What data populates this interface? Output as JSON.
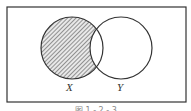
{
  "diagram": {
    "type": "venn",
    "universe": {
      "x": 7,
      "y": 7,
      "width": 179,
      "height": 95
    },
    "sets": [
      {
        "name": "X",
        "label": "X",
        "cx": 72,
        "cy": 48,
        "r": 31
      },
      {
        "name": "Y",
        "label": "Y",
        "cx": 121,
        "cy": 48,
        "r": 31
      }
    ],
    "shaded_region": "X minus Y",
    "shade_style": "diagonal-hatch",
    "colors": {
      "stroke": "#333333",
      "hatch": "#555555",
      "background": "#ffffff"
    },
    "caption": "图 1 - 2 - 3"
  }
}
